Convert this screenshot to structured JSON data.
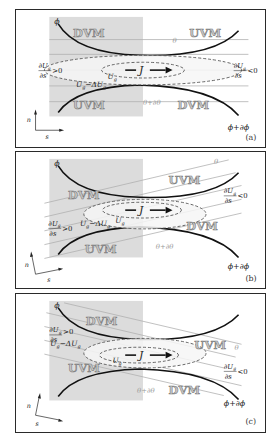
{
  "figure": {
    "panels": [
      {
        "id": "a",
        "caption": "(a)",
        "phi_top": "ϕ",
        "phi_bottom": "ϕ+∂ϕ",
        "theta_top": "θ",
        "theta_bottom": "θ+∂θ",
        "region_top_left": "DVM",
        "region_top_right": "UVM",
        "region_bottom_left": "UVM",
        "region_bottom_right": "DVM",
        "current": "J",
        "ug_label": "U",
        "ug_sub": "g",
        "ug_minus_label": "U",
        "ug_minus_sub": "g",
        "ug_minus_rest": "−ΔU",
        "deriv_left": {
          "num": "∂U",
          "sub": "g",
          "den": "∂s",
          "rel": ">0"
        },
        "deriv_right": {
          "num": "∂U",
          "sub": "g",
          "den": "∂s",
          "rel": "<0"
        },
        "axis_n": "n",
        "axis_s": "s"
      },
      {
        "id": "b",
        "caption": "(b)",
        "phi_top": "ϕ",
        "phi_bottom": "ϕ+∂ϕ",
        "theta_top": "θ",
        "theta_bottom": "θ+∂θ",
        "region_top_left": "DVM",
        "region_top_right": "UVM",
        "region_bottom_left": "UVM",
        "region_bottom_right": "DVM",
        "current": "J",
        "ug_label": "U",
        "ug_sub": "g",
        "ug_minus_label": "U",
        "ug_minus_sub": "g",
        "ug_minus_rest": "−ΔU",
        "deriv_left": {
          "num": "∂U",
          "sub": "g",
          "den": "∂s",
          "rel": ">0"
        },
        "deriv_right": {
          "num": "∂U",
          "sub": "g",
          "den": "∂s",
          "rel": "<0"
        },
        "axis_n": "n",
        "axis_s": "s"
      },
      {
        "id": "c",
        "caption": "(c)",
        "phi_top": "ϕ",
        "phi_bottom": "ϕ+∂ϕ",
        "theta_top": "θ",
        "theta_bottom": "θ+∂θ",
        "region_top_left": "DVM",
        "region_top_right": "UVM",
        "region_bottom_left": "UVM",
        "region_bottom_right": "DVM",
        "current": "J",
        "ug_label": "U",
        "ug_sub": "g",
        "ug_minus_label": "U",
        "ug_minus_sub": "g",
        "ug_minus_rest": "−ΔU",
        "deriv_left": {
          "num": "∂U",
          "sub": "g",
          "den": "∂s",
          "rel": ">0"
        },
        "deriv_right": {
          "num": "∂U",
          "sub": "g",
          "den": "∂s",
          "rel": "<0"
        },
        "axis_n": "n",
        "axis_s": "s"
      }
    ],
    "colors": {
      "shade": "#dcdcdc",
      "contour_line": "#b0b0b0",
      "field_line": "#111111",
      "ellipse": "#555555",
      "region_fill": "#c8c8c8"
    }
  }
}
